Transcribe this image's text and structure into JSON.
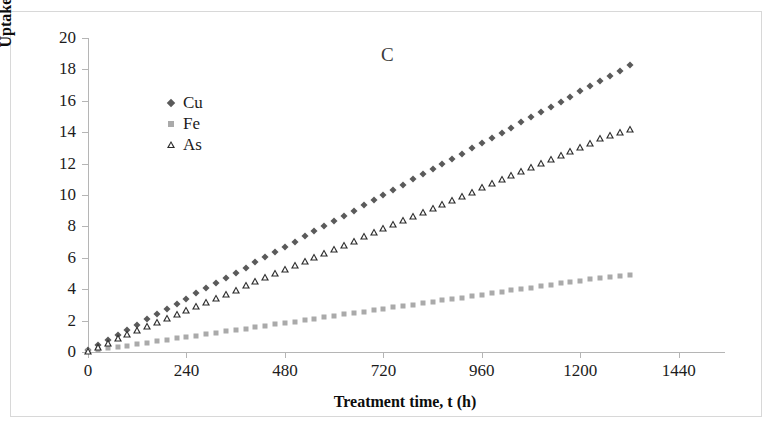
{
  "figure": {
    "panel_label": "C",
    "background": "#ffffff",
    "border_color": "#d8d8d8"
  },
  "chart_data": {
    "type": "scatter",
    "title": "C",
    "xlabel": "Treatment time, t (h)",
    "ylabel": "Uptake, q (mg g",
    "ylabel_sup": "-1",
    "ylabel_tail": ")",
    "xlim": [
      0,
      1560
    ],
    "ylim": [
      0,
      20
    ],
    "xticks": [
      0,
      240,
      480,
      720,
      960,
      1200,
      1440
    ],
    "yticks": [
      0,
      2,
      4,
      6,
      8,
      10,
      12,
      14,
      16,
      18,
      20
    ],
    "grid": false,
    "legend_position": "upper-left-inside",
    "series": [
      {
        "name": "Cu",
        "marker": "diamond",
        "color": "#5a5a5a",
        "x": [
          0,
          24,
          48,
          72,
          96,
          120,
          144,
          168,
          192,
          216,
          240,
          264,
          288,
          312,
          336,
          360,
          384,
          408,
          432,
          456,
          480,
          504,
          528,
          552,
          576,
          600,
          624,
          648,
          672,
          696,
          720,
          744,
          768,
          792,
          816,
          840,
          864,
          888,
          912,
          936,
          960,
          984,
          1008,
          1032,
          1056,
          1080,
          1104,
          1128,
          1152,
          1176,
          1200,
          1224,
          1248,
          1272,
          1296,
          1320
        ],
        "y": [
          0.1,
          0.43,
          0.76,
          1.09,
          1.42,
          1.75,
          2.08,
          2.41,
          2.74,
          3.07,
          3.4,
          3.73,
          4.06,
          4.39,
          4.72,
          5.05,
          5.38,
          5.71,
          6.04,
          6.37,
          6.7,
          7.03,
          7.36,
          7.69,
          8.02,
          8.35,
          8.68,
          9.01,
          9.34,
          9.67,
          10.0,
          10.33,
          10.66,
          10.99,
          11.32,
          11.65,
          11.98,
          12.31,
          12.64,
          12.97,
          13.3,
          13.63,
          13.96,
          14.29,
          14.62,
          14.95,
          15.28,
          15.61,
          15.94,
          16.27,
          16.6,
          16.93,
          17.26,
          17.59,
          17.92,
          18.3
        ]
      },
      {
        "name": "Fe",
        "marker": "square",
        "color": "#aaaaaa",
        "x": [
          0,
          24,
          48,
          72,
          96,
          120,
          144,
          168,
          192,
          216,
          240,
          264,
          288,
          312,
          336,
          360,
          384,
          408,
          432,
          456,
          480,
          504,
          528,
          552,
          576,
          600,
          624,
          648,
          672,
          696,
          720,
          744,
          768,
          792,
          816,
          840,
          864,
          888,
          912,
          936,
          960,
          984,
          1008,
          1032,
          1056,
          1080,
          1104,
          1128,
          1152,
          1176,
          1200,
          1224,
          1248,
          1272,
          1296,
          1320
        ],
        "y": [
          0.05,
          0.14,
          0.23,
          0.32,
          0.41,
          0.5,
          0.59,
          0.68,
          0.77,
          0.86,
          0.95,
          1.04,
          1.13,
          1.22,
          1.31,
          1.4,
          1.49,
          1.58,
          1.67,
          1.76,
          1.85,
          1.94,
          2.03,
          2.12,
          2.21,
          2.3,
          2.39,
          2.48,
          2.57,
          2.66,
          2.75,
          2.84,
          2.93,
          3.02,
          3.11,
          3.2,
          3.29,
          3.38,
          3.47,
          3.56,
          3.65,
          3.74,
          3.83,
          3.92,
          4.01,
          4.1,
          4.19,
          4.28,
          4.37,
          4.46,
          4.55,
          4.64,
          4.73,
          4.79,
          4.85,
          4.92
        ]
      },
      {
        "name": "As",
        "marker": "triangle",
        "color": "#2b2b2b",
        "x": [
          0,
          24,
          48,
          72,
          96,
          120,
          144,
          168,
          192,
          216,
          240,
          264,
          288,
          312,
          336,
          360,
          384,
          408,
          432,
          456,
          480,
          504,
          528,
          552,
          576,
          600,
          624,
          648,
          672,
          696,
          720,
          744,
          768,
          792,
          816,
          840,
          864,
          888,
          912,
          936,
          960,
          984,
          1008,
          1032,
          1056,
          1080,
          1104,
          1128,
          1152,
          1176,
          1200,
          1224,
          1248,
          1272,
          1296,
          1320
        ],
        "y": [
          0.08,
          0.34,
          0.6,
          0.86,
          1.12,
          1.38,
          1.64,
          1.9,
          2.16,
          2.42,
          2.68,
          2.94,
          3.2,
          3.46,
          3.72,
          3.98,
          4.24,
          4.5,
          4.76,
          5.02,
          5.28,
          5.54,
          5.8,
          6.06,
          6.32,
          6.58,
          6.84,
          7.1,
          7.36,
          7.62,
          7.88,
          8.14,
          8.4,
          8.66,
          8.92,
          9.18,
          9.44,
          9.7,
          9.96,
          10.22,
          10.48,
          10.74,
          11.0,
          11.26,
          11.52,
          11.78,
          12.04,
          12.3,
          12.56,
          12.82,
          13.08,
          13.34,
          13.6,
          13.82,
          14.02,
          14.2
        ]
      }
    ]
  }
}
